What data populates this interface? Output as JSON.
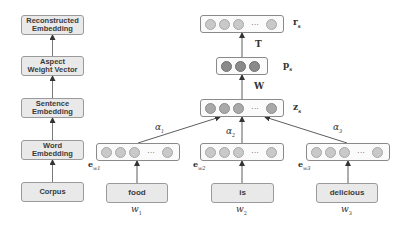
{
  "pipeline": {
    "steps": [
      {
        "label_line1": "Reconstructed",
        "label_line2": "Embedding"
      },
      {
        "label_line1": "Aspect",
        "label_line2": "Weight Vector"
      },
      {
        "label_line1": "Sentence",
        "label_line2": "Embedding"
      },
      {
        "label_line1": "Word",
        "label_line2": "Embedding"
      },
      {
        "label_line1": "Corpus",
        "label_line2": ""
      }
    ]
  },
  "network": {
    "vectors": {
      "r": {
        "label": "r",
        "subscript": "s"
      },
      "p": {
        "label": "p",
        "subscript": "s"
      },
      "z": {
        "label": "z",
        "subscript": "s"
      },
      "e1": {
        "label": "e",
        "subscript": "w1"
      },
      "e2": {
        "label": "e",
        "subscript": "w2"
      },
      "e3": {
        "label": "e",
        "subscript": "w3"
      }
    },
    "ellipsis": "···",
    "weights": {
      "T": "T",
      "W": "W"
    },
    "attention": [
      {
        "symbol": "α",
        "subscript": "1"
      },
      {
        "symbol": "α",
        "subscript": "2"
      },
      {
        "symbol": "α",
        "subscript": "3"
      }
    ],
    "words": [
      {
        "text": "food",
        "var": "w",
        "subscript": "1"
      },
      {
        "text": "is",
        "var": "w",
        "subscript": "2"
      },
      {
        "text": "delicious",
        "var": "w",
        "subscript": "3"
      }
    ]
  },
  "colors": {
    "box_fill": "#e9e9e9",
    "circle_light": "#c9c9c9",
    "circle_dark": "#8a8a8a",
    "arrow": "#333333"
  }
}
